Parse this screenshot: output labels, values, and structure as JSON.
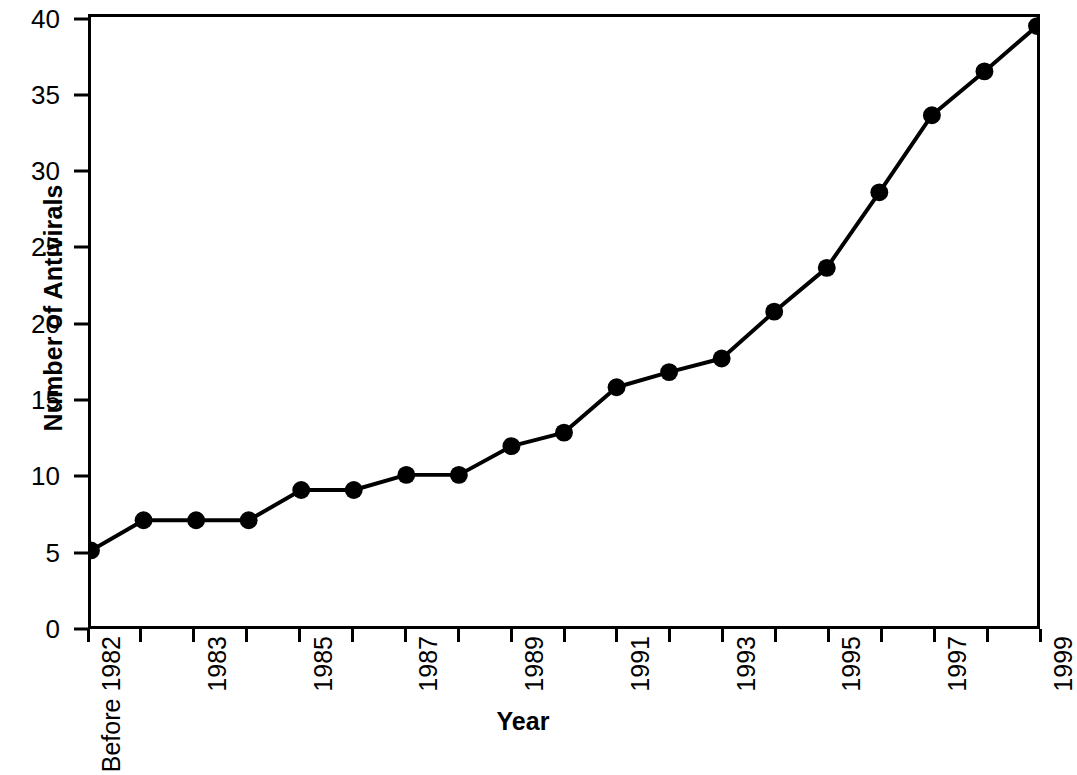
{
  "chart_data": {
    "type": "line",
    "title": "",
    "xlabel": "Year",
    "ylabel": "Number of Antivirals",
    "categories": [
      "Before 1982",
      "1982",
      "1983",
      "1984",
      "1985",
      "1986",
      "1987",
      "1988",
      "1989",
      "1990",
      "1991",
      "1992",
      "1993",
      "1994",
      "1995",
      "1996",
      "1997",
      "1998",
      "1999"
    ],
    "values": [
      5,
      7,
      7,
      7,
      9,
      9,
      10,
      10,
      11.9,
      12.8,
      15.8,
      16.8,
      17.7,
      20.8,
      23.7,
      28.7,
      33.8,
      36.7,
      39.7
    ],
    "series": [
      {
        "name": "Number of Antivirals",
        "values": [
          5,
          7,
          7,
          7,
          9,
          9,
          10,
          10,
          11.9,
          12.8,
          15.8,
          16.8,
          17.7,
          20.8,
          23.7,
          28.7,
          33.8,
          36.7,
          39.7
        ]
      }
    ],
    "x_tick_labels": [
      "Before 1982",
      "",
      "1983",
      "",
      "1985",
      "",
      "1987",
      "",
      "1989",
      "",
      "1991",
      "",
      "1993",
      "",
      "1995",
      "",
      "1997",
      "",
      "1999"
    ],
    "y_tick_labels": [
      "0",
      "5",
      "10",
      "15",
      "20",
      "25",
      "30",
      "35",
      "40"
    ],
    "y_ticks": [
      0,
      5,
      10,
      15,
      20,
      25,
      30,
      35,
      40
    ],
    "ylim": [
      0,
      40.3
    ],
    "xlim_index": [
      0,
      18
    ],
    "grid": false,
    "legend": false,
    "legend_position": "none",
    "marker": "filled-circle",
    "line_color": "#000000",
    "marker_color": "#000000",
    "background_color": "#ffffff",
    "frame_color": "#000000"
  }
}
